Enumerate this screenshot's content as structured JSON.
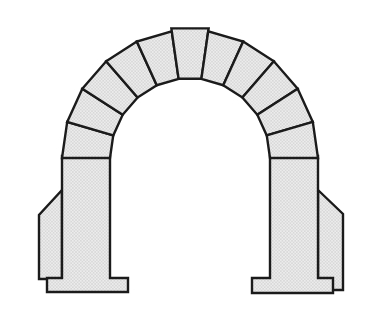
{
  "figure": {
    "background": "#ffffff"
  },
  "style": {
    "outline_color": "#1b1b1b",
    "outline_width": 2.4,
    "stone_base_color": "#ececec",
    "stone_dot_color": "#b5b5b5"
  },
  "arch": {
    "center_x": 190,
    "center_y": 158,
    "inner_radius": 80,
    "outer_radius": 128,
    "keystone_outer_radius": 131,
    "voussoir_count": 11,
    "springing_y": 158
  },
  "supports": [
    {
      "name": "left-pier-and-footing",
      "points": [
        [
          62,
          156
        ],
        [
          110,
          156
        ],
        [
          110,
          278
        ],
        [
          128,
          278
        ],
        [
          128,
          292
        ],
        [
          47,
          292
        ],
        [
          47,
          278
        ],
        [
          62,
          278
        ]
      ]
    },
    {
      "name": "right-pier-and-footing",
      "points": [
        [
          270,
          156
        ],
        [
          318,
          156
        ],
        [
          318,
          278
        ],
        [
          333,
          278
        ],
        [
          333,
          293
        ],
        [
          252,
          293
        ],
        [
          252,
          278
        ],
        [
          270,
          278
        ]
      ]
    }
  ],
  "buttresses": [
    {
      "name": "left-buttress",
      "points": [
        [
          62,
          190
        ],
        [
          39,
          215
        ],
        [
          39,
          279
        ],
        [
          62,
          279
        ]
      ]
    },
    {
      "name": "right-buttress",
      "points": [
        [
          318,
          190
        ],
        [
          343,
          214
        ],
        [
          343,
          290
        ],
        [
          318,
          290
        ]
      ]
    }
  ]
}
